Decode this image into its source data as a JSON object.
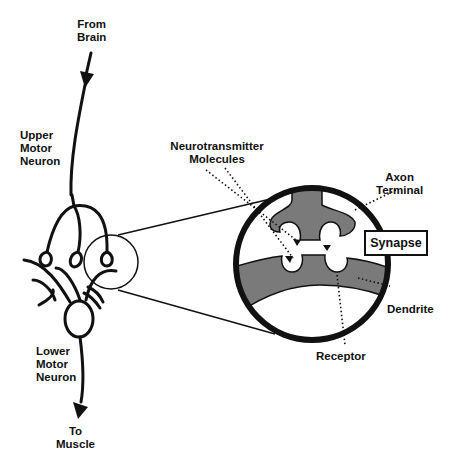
{
  "diagram": {
    "colors": {
      "stroke": "#111111",
      "fill_gray": "#7a7a7a",
      "background": "#ffffff"
    },
    "labels": {
      "from_brain": "From\nBrain",
      "from_brain_l1": "From",
      "from_brain_l2": "Brain",
      "upper_l1": "Upper",
      "upper_l2": "Motor",
      "upper_l3": "Neuron",
      "lower_l1": "Lower",
      "lower_l2": "Motor",
      "lower_l3": "Neuron",
      "to_l1": "To",
      "to_l2": "Muscle",
      "nt_l1": "Neurotransmitter",
      "nt_l2": "Molecules",
      "axon_l1": "Axon",
      "axon_l2": "Terminal",
      "synapse": "Synapse",
      "dendrite": "Dendrite",
      "receptor": "Receptor"
    }
  }
}
